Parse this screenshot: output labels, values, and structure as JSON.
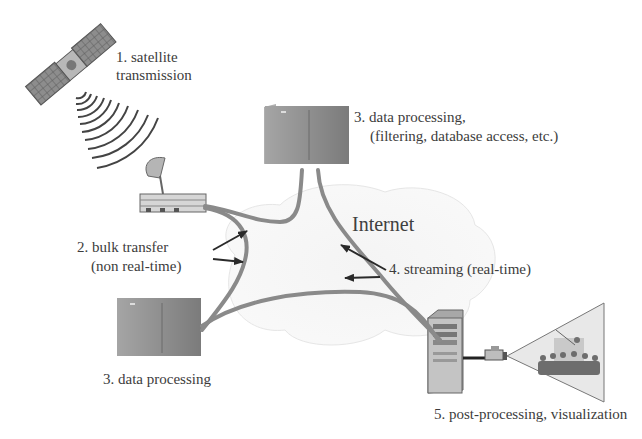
{
  "diagram": {
    "type": "network-data-flow",
    "cloud_label": "Internet",
    "nodes": [
      {
        "id": "satellite",
        "icon": "satellite-icon",
        "label_lines": [
          "1. satellite",
          "transmission"
        ]
      },
      {
        "id": "ground-station",
        "icon": "satellite-dish-building-icon",
        "label_lines": []
      },
      {
        "id": "processing-top",
        "icon": "server-cabinet-icon",
        "label_lines": [
          "3. data processing,",
          "(filtering, database access, etc.)"
        ]
      },
      {
        "id": "processing-bottom",
        "icon": "server-cabinet-icon",
        "label_lines": [
          "3. data processing"
        ]
      },
      {
        "id": "workstation",
        "icon": "tower-computer-icon",
        "label_lines": []
      },
      {
        "id": "projection",
        "icon": "projector-audience-icon",
        "label_lines": [
          "5. post-processing, visualization"
        ]
      }
    ],
    "flows": [
      {
        "id": "bulk",
        "label_lines": [
          "2. bulk transfer",
          "(non real-time)"
        ],
        "arrows": 2
      },
      {
        "id": "streaming",
        "label_lines": [
          "4. streaming (real-time)"
        ],
        "arrows": 2
      }
    ],
    "colors": {
      "link": "#8a8a8a",
      "arrow": "#2a2a2a",
      "cloud": "#f1f1f1",
      "cabinet": "#8f8f8f",
      "text": "#3c3c3c"
    }
  }
}
